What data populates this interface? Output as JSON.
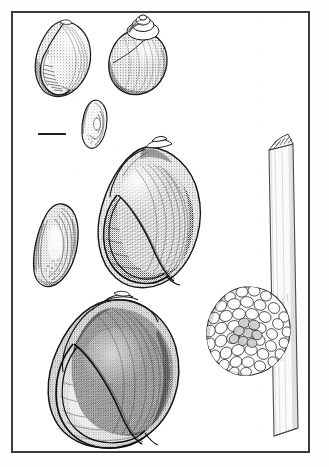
{
  "plate": {
    "kind": "scientific-illustration-plate",
    "medium": "pen-and-ink stipple drawing",
    "subject": "apple snail shells, opercula and egg mass",
    "background_color": "#ffffff",
    "ink_color": "#2a2a2a",
    "frame": {
      "color": "#3c3c3c",
      "thickness_px": 2,
      "x": 11,
      "y": 11,
      "width": 299,
      "height": 442
    },
    "scale_bar": {
      "label": "",
      "x": 38,
      "y": 133,
      "length_px": 28,
      "thickness_px": 2,
      "color": "#1d1d1d"
    },
    "figures": [
      {
        "id": "shell-small-apertural",
        "name": "small shell apertural view",
        "x": 30,
        "y": 17,
        "width": 66,
        "height": 80,
        "caption": ""
      },
      {
        "id": "shell-small-dorsal",
        "name": "small shell dorsal view with spire",
        "x": 101,
        "y": 13,
        "width": 70,
        "height": 84,
        "caption": ""
      },
      {
        "id": "operculum-small",
        "name": "small operculum",
        "x": 76,
        "y": 97,
        "width": 36,
        "height": 50,
        "caption": ""
      },
      {
        "id": "shell-large-apertural",
        "name": "large shell apertural view",
        "x": 88,
        "y": 135,
        "width": 122,
        "height": 155,
        "caption": ""
      },
      {
        "id": "operculum-large",
        "name": "large operculum",
        "x": 28,
        "y": 198,
        "width": 58,
        "height": 90,
        "caption": ""
      },
      {
        "id": "shell-largest-apertural",
        "name": "largest shell apertural view",
        "x": 38,
        "y": 288,
        "width": 145,
        "height": 155,
        "caption": ""
      },
      {
        "id": "plant-stem",
        "name": "plant stem with broken tip",
        "x": 246,
        "y": 128,
        "width": 50,
        "height": 325,
        "caption": ""
      },
      {
        "id": "egg-mass",
        "name": "egg mass clutch attached to stem",
        "x": 196,
        "y": 279,
        "width": 92,
        "height": 93,
        "caption": ""
      }
    ]
  }
}
